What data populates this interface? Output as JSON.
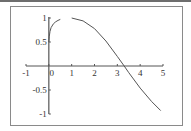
{
  "chart_data": {
    "type": "line",
    "title": "",
    "xlabel": "",
    "ylabel": "",
    "xlim": [
      -1,
      5
    ],
    "ylim": [
      -1,
      1
    ],
    "grid": false,
    "legend": null,
    "x_ticks": [
      "-1",
      "0",
      "1",
      "2",
      "3",
      "4",
      "5"
    ],
    "y_ticks": [
      "1",
      "0.5",
      "-0.5",
      "-1"
    ],
    "series": [
      {
        "name": "curve-1",
        "x": [
          0.0,
          0.02,
          0.05,
          0.1,
          0.2,
          0.3,
          0.4,
          0.5
        ],
        "y": [
          0.5,
          0.62,
          0.72,
          0.8,
          0.88,
          0.92,
          0.95,
          0.97
        ]
      },
      {
        "name": "curve-2",
        "x": [
          1.0,
          1.5,
          2.0,
          2.5,
          3.0,
          3.3,
          3.5,
          4.0,
          4.5,
          4.9
        ],
        "y": [
          1.0,
          0.94,
          0.78,
          0.52,
          0.2,
          0.0,
          -0.14,
          -0.46,
          -0.74,
          -0.93
        ]
      }
    ]
  },
  "colors": {
    "frame": "#888888",
    "axis": "#555555",
    "line": "#555555",
    "text": "#333333",
    "topbar": "#6e6e6e"
  }
}
